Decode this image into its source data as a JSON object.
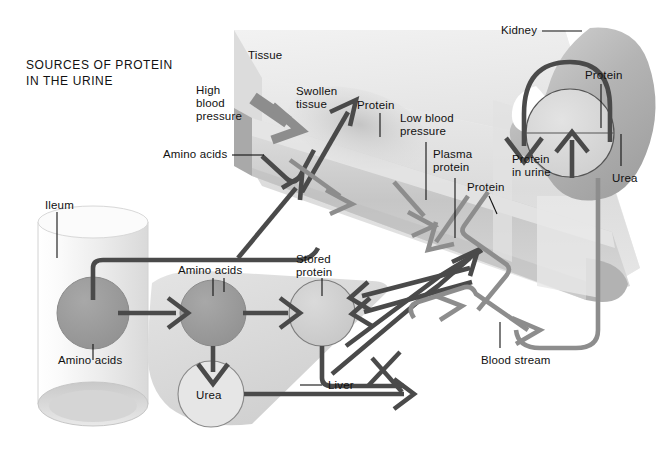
{
  "figure": {
    "title_line1": "SOURCES OF PROTEIN",
    "title_line2": "IN THE URINE",
    "domain_kind": "biological-flow-diagram"
  },
  "colors": {
    "ink": "#111111",
    "dark_arrow": "#4a4a4a",
    "mid_arrow": "#8d8d8d",
    "tissue_light": "#ebebeb",
    "tissue_mid": "#d8d8d8",
    "tissue_dark": "#c2c2c2",
    "vessel_band": "#d0d0d0",
    "liver_fill": "#dcdcdc",
    "circle_dark": "#9a9a9a",
    "circle_light": "#cfcfcf",
    "kidney_fill": "#b8b8b8",
    "ileum_fill": "#efefef",
    "background": "#ffffff"
  },
  "labels": [
    {
      "id": "tissue",
      "text": "Tissue",
      "x": 248,
      "y": 49,
      "name": "label-tissue"
    },
    {
      "id": "high_blood_press",
      "text": "High\nblood\npressure",
      "x": 196,
      "y": 84,
      "name": "label-high-blood-pressure"
    },
    {
      "id": "swollen_tissue",
      "text": "Swollen\ntissue",
      "x": 296,
      "y": 85,
      "name": "label-swollen-tissue"
    },
    {
      "id": "protein_tissue",
      "text": "Protein",
      "x": 357,
      "y": 99,
      "name": "label-protein-tissue"
    },
    {
      "id": "amino_acids_tissue",
      "text": "Amino acids",
      "x": 163,
      "y": 148,
      "name": "label-amino-acids-tissue"
    },
    {
      "id": "low_blood_press",
      "text": "Low blood\npressure",
      "x": 400,
      "y": 112,
      "name": "label-low-blood-pressure"
    },
    {
      "id": "plasma_protein",
      "text": "Plasma\nprotein",
      "x": 433,
      "y": 148,
      "name": "label-plasma-protein"
    },
    {
      "id": "protein_plasma",
      "text": "Protein",
      "x": 467,
      "y": 181,
      "name": "label-protein-plasma"
    },
    {
      "id": "kidney",
      "text": "Kidney",
      "x": 501,
      "y": 24,
      "name": "label-kidney"
    },
    {
      "id": "protein_kidney",
      "text": "Protein",
      "x": 585,
      "y": 69,
      "name": "label-protein-kidney"
    },
    {
      "id": "protein_in_urine",
      "text": "Protein\nin urine",
      "x": 512,
      "y": 153,
      "name": "label-protein-in-urine"
    },
    {
      "id": "urea_kidney",
      "text": "Urea",
      "x": 612,
      "y": 172,
      "name": "label-urea-kidney"
    },
    {
      "id": "ileum",
      "text": "Ileum",
      "x": 45,
      "y": 199,
      "name": "label-ileum"
    },
    {
      "id": "amino_acids_liver",
      "text": "Amino acids",
      "x": 178,
      "y": 264,
      "name": "label-amino-acids-liver"
    },
    {
      "id": "stored_protein",
      "text": "Stored\nprotein",
      "x": 296,
      "y": 253,
      "name": "label-stored-protein"
    },
    {
      "id": "amino_acids_ileum",
      "text": "Amino acids",
      "x": 58,
      "y": 354,
      "name": "label-amino-acids-ileum"
    },
    {
      "id": "urea_liver",
      "text": "Urea",
      "x": 196,
      "y": 389,
      "name": "label-urea-liver"
    },
    {
      "id": "liver",
      "text": "Liver",
      "x": 328,
      "y": 379,
      "name": "label-liver"
    },
    {
      "id": "blood_stream",
      "text": "Blood stream",
      "x": 481,
      "y": 354,
      "name": "label-blood-stream"
    }
  ],
  "structures": {
    "ileum": {
      "name": "Ileum",
      "shape": "cylinder"
    },
    "liver": {
      "name": "Liver",
      "shape": "lobe"
    },
    "kidney": {
      "name": "Kidney",
      "shape": "bean"
    },
    "tissue_slab": {
      "name": "Tissue",
      "shape": "diagonal-slab"
    },
    "blood_vessel": {
      "name": "Blood stream",
      "shape": "diagonal-tube"
    },
    "glomerulus": {
      "name": "glomerulus",
      "shape": "circle"
    }
  },
  "nodes": [
    {
      "id": "aa_ileum",
      "label": "Amino acids",
      "tone": "dark"
    },
    {
      "id": "aa_liver",
      "label": "Amino acids",
      "tone": "dark"
    },
    {
      "id": "stored",
      "label": "Stored protein",
      "tone": "light"
    },
    {
      "id": "urea",
      "label": "Urea",
      "tone": "light"
    }
  ],
  "flows": [
    {
      "from": "ileum",
      "to": "liver",
      "substance": "Amino acids",
      "tone": "dark"
    },
    {
      "from": "liver",
      "to": "stored",
      "substance": "Amino acids",
      "tone": "dark"
    },
    {
      "from": "liver",
      "to": "urea",
      "substance": "Urea",
      "tone": "dark"
    },
    {
      "from": "urea",
      "to": "blood_stream",
      "substance": "Urea",
      "tone": "dark"
    },
    {
      "from": "stored",
      "to": "blood_stream",
      "substance": "Protein",
      "tone": "dark"
    },
    {
      "from": "blood_stream",
      "to": "tissue",
      "substance": "Protein",
      "tone": "mid"
    },
    {
      "from": "tissue",
      "to": "blood_stream",
      "substance": "Amino acids",
      "tone": "dark"
    },
    {
      "from": "blood_stream",
      "to": "kidney",
      "substance": "Protein",
      "tone": "mid"
    },
    {
      "from": "kidney",
      "to": "urine",
      "substance": "Protein in urine",
      "tone": "dark"
    }
  ]
}
